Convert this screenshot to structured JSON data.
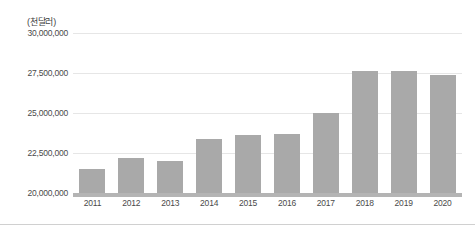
{
  "chart_data": {
    "type": "bar",
    "title": "",
    "subtitle": "",
    "unit_caption": "(천달러)",
    "xlabel": "",
    "ylabel": "",
    "categories": [
      "2011",
      "2012",
      "2013",
      "2014",
      "2015",
      "2016",
      "2017",
      "2018",
      "2019",
      "2020"
    ],
    "values": [
      21500000,
      22200000,
      22000000,
      23400000,
      23600000,
      23700000,
      25000000,
      27600000,
      27650000,
      27400000
    ],
    "series": [
      {
        "name": "",
        "values": [
          21500000,
          22200000,
          22000000,
          23400000,
          23600000,
          23700000,
          25000000,
          27600000,
          27650000,
          27400000
        ]
      }
    ],
    "ylim": [
      20000000,
      30000000
    ],
    "y_ticks": [
      20000000,
      22500000,
      25000000,
      27500000,
      30000000
    ],
    "y_tick_labels": [
      "20,000,000",
      "22,500,000",
      "25,000,000",
      "27,500,000",
      "30,000,000"
    ],
    "grid": true,
    "legend": false,
    "legend_position": "none",
    "bar_color": "#a9a9a9",
    "gridline_color": "#e6e6e6",
    "baseline_color": "#b4b4b4",
    "text_color": "#4a4a4a",
    "background_color": "#ffffff"
  }
}
